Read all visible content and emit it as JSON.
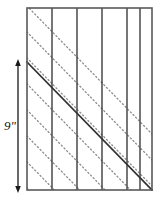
{
  "figure": {
    "width": 162,
    "height": 201,
    "background_color": "#ffffff"
  },
  "colors": {
    "rectangle_stroke": "#595959",
    "vertical_line_stroke": "#3d3d3d",
    "solid_diagonal_stroke": "#333333",
    "dotted_diagonal_stroke": "#8c8c8c",
    "dimension_stroke": "#1a1a1a",
    "label_color": "#1a1a1a"
  },
  "rectangle": {
    "x": 27,
    "y": 8,
    "width": 125,
    "height": 182,
    "stroke_width": 1.6
  },
  "vertical_lines": {
    "count": 5,
    "x_positions": [
      52,
      77,
      102,
      127,
      140
    ],
    "stroke_width": 1.4,
    "y_top": 8,
    "y_bottom": 190
  },
  "solid_diagonal": {
    "x1": 27,
    "y1": 62,
    "x2": 152,
    "y2": 190,
    "stroke_width": 1.7
  },
  "dotted_diagonals": {
    "count": 8,
    "stroke_width": 1.3,
    "dash_pattern": "1.2 2.6",
    "offsets_y_at_left_edge": [
      -56,
      -30,
      -4,
      22,
      48,
      74,
      100,
      126
    ]
  },
  "dimension": {
    "label": "9\"",
    "label_x": 10,
    "label_y": 130,
    "line_x": 18,
    "y_top": 62,
    "y_bottom": 190,
    "stroke_width": 1.3,
    "arrowhead_size": 4
  }
}
